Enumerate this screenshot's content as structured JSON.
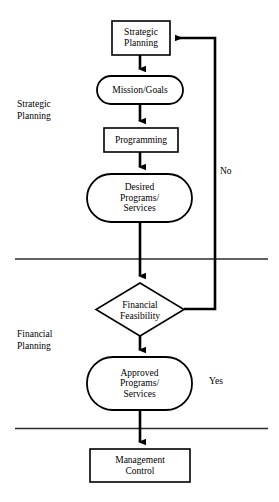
{
  "diagram": {
    "type": "flowchart",
    "colors": {
      "stroke": "#000000",
      "fill": "#ffffff",
      "divider": "#2b2b2b"
    },
    "nodes": [
      {
        "id": "strategic-planning",
        "shape": "rectangle",
        "label": "Strategic\nPlanning",
        "x": 112,
        "y": 21,
        "width": 58,
        "height": 34
      },
      {
        "id": "mission-goals",
        "shape": "stadium",
        "label": "Mission/Goals",
        "x": 97,
        "y": 76,
        "width": 86,
        "height": 28
      },
      {
        "id": "programming",
        "shape": "rectangle",
        "label": "Programming",
        "x": 104,
        "y": 128,
        "width": 74,
        "height": 24
      },
      {
        "id": "desired-programs-services",
        "shape": "stadium",
        "label": "Desired\nPrograms/\nServices",
        "x": 87,
        "y": 174,
        "width": 105,
        "height": 48
      },
      {
        "id": "financial-feasibility",
        "shape": "diamond",
        "label": "Financial\nFeasibility",
        "x": 96,
        "y": 283,
        "width": 88,
        "height": 53
      },
      {
        "id": "approved-programs-services",
        "shape": "stadium",
        "label": "Approved\nPrograms/\nServices",
        "x": 87,
        "y": 357,
        "width": 105,
        "height": 53
      },
      {
        "id": "management-control",
        "shape": "rectangle",
        "label": "Management\nControl",
        "x": 90,
        "y": 449,
        "width": 100,
        "height": 33
      }
    ],
    "edge_labels": [
      {
        "id": "no-label",
        "text": "No",
        "x": 220,
        "y": 166
      },
      {
        "id": "yes-label",
        "text": "Yes",
        "x": 209,
        "y": 376
      }
    ],
    "section_labels": [
      {
        "id": "strategic-planning-section",
        "text": "Strategic\nPlanning",
        "x": 17,
        "y": 98
      },
      {
        "id": "financial-planning-section",
        "text": "Financial\nPlanning",
        "x": 17,
        "y": 328
      }
    ],
    "dividers": [
      {
        "id": "divider-strategic-financial",
        "y": 259,
        "x1": 15,
        "x2": 268
      },
      {
        "id": "divider-financial-control",
        "y": 428,
        "x1": 15,
        "x2": 268
      }
    ],
    "feedback_loop": {
      "id": "no-feedback-loop",
      "from": "financial-feasibility",
      "to": "strategic-planning",
      "label": "No",
      "vertical_x": 215
    }
  }
}
